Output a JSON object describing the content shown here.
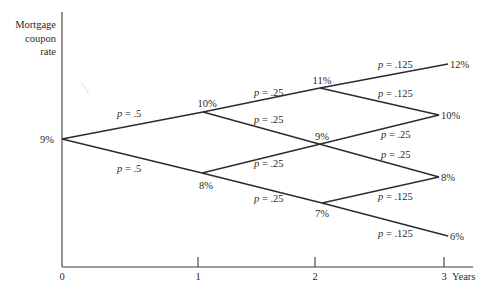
{
  "diagram": {
    "type": "binomial interest-rate tree",
    "y_axis_label": [
      "Mortgage",
      "coupon",
      "rate"
    ],
    "x_axis": {
      "ticks": [
        "0",
        "1",
        "2",
        "3"
      ],
      "unit_label": "Years"
    },
    "nodes": [
      {
        "id": "n0",
        "year": 0,
        "rate": "9%"
      },
      {
        "id": "n1u",
        "year": 1,
        "rate": "10%"
      },
      {
        "id": "n1d",
        "year": 1,
        "rate": "8%"
      },
      {
        "id": "n2u",
        "year": 2,
        "rate": "11%"
      },
      {
        "id": "n2m",
        "year": 2,
        "rate": "9%"
      },
      {
        "id": "n2d",
        "year": 2,
        "rate": "7%"
      },
      {
        "id": "n3a",
        "year": 3,
        "rate": "12%"
      },
      {
        "id": "n3b",
        "year": 3,
        "rate": "10%"
      },
      {
        "id": "n3c",
        "year": 3,
        "rate": "8%"
      },
      {
        "id": "n3d",
        "year": 3,
        "rate": "6%"
      }
    ],
    "branches": [
      {
        "from": "9%",
        "to": "10%",
        "prob_label": "p = .5"
      },
      {
        "from": "9%",
        "to": "8%",
        "prob_label": "p = .5"
      },
      {
        "from": "10%",
        "to": "11%",
        "prob_label": "p = .25"
      },
      {
        "from": "10%",
        "to": "9%",
        "prob_label": "p = .25"
      },
      {
        "from": "8%",
        "to": "9%",
        "prob_label": "p = .25"
      },
      {
        "from": "8%",
        "to": "7%",
        "prob_label": "p = .25"
      },
      {
        "from": "11%",
        "to": "12%",
        "prob_label": "p = .125"
      },
      {
        "from": "11%",
        "to": "10%",
        "prob_label": "p = .125"
      },
      {
        "from": "9%",
        "to": "10%",
        "prob_label": "p = .25"
      },
      {
        "from": "9%",
        "to": "8%",
        "prob_label": "p = .25"
      },
      {
        "from": "7%",
        "to": "8%",
        "prob_label": "p = .125"
      },
      {
        "from": "7%",
        "to": "6%",
        "prob_label": "p = .125"
      }
    ],
    "prob_prefix": "p",
    "prob_values": {
      "b0u": " = .5",
      "b0d": " = .5",
      "b1uu": " = .25",
      "b1ud": " = .25",
      "b1du": " = .25",
      "b1dd": " = .25",
      "b2uu": " = .125",
      "b2ud": " = .125",
      "b2mu": " = .25",
      "b2md": " = .25",
      "b2du": " = .125",
      "b2dd": " = .125"
    },
    "rate_labels": {
      "n0": "9%",
      "n1u": "10%",
      "n1d": "8%",
      "n2u": "11%",
      "n2m": "9%",
      "n2d": "7%",
      "n3a": "12%",
      "n3b": "10%",
      "n3c": "8%",
      "n3d": "6%"
    },
    "colors": {
      "line": "#2b2b2b",
      "text": "#2a2a2a",
      "background": "#ffffff"
    }
  }
}
